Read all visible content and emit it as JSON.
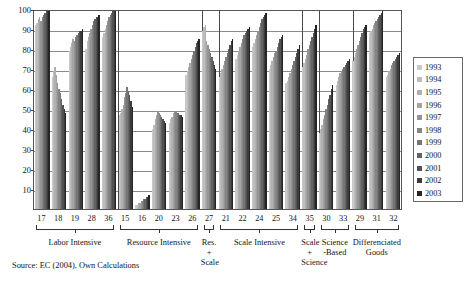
{
  "chart_data": {
    "type": "bar",
    "title": "",
    "subtitle": "",
    "xlabel": "",
    "ylabel": "",
    "ylim": [
      0,
      100
    ],
    "yticks": [
      100,
      90,
      80,
      70,
      60,
      50,
      40,
      30,
      20,
      10
    ],
    "grid": true,
    "legend_position": "right",
    "legend_entries": [
      "1993",
      "1994",
      "1995",
      "1996",
      "1997",
      "1998",
      "1999",
      "2000",
      "2001",
      "2002",
      "2003"
    ],
    "series_colors": [
      "#c9c9c9",
      "#bdbdbd",
      "#b0b0b0",
      "#a3a3a3",
      "#949494",
      "#858585",
      "#757575",
      "#636363",
      "#515151",
      "#3c3c3c",
      "#252525"
    ],
    "categories": [
      "17",
      "18",
      "19",
      "28",
      "36",
      "15",
      "16",
      "20",
      "23",
      "26",
      "27",
      "21",
      "22",
      "24",
      "25",
      "34",
      "35",
      "30",
      "33",
      "29",
      "31",
      "32"
    ],
    "groups": [
      {
        "label": "Labor Intensive",
        "categories": [
          "17",
          "18",
          "19",
          "28",
          "36"
        ]
      },
      {
        "label": "Resource Intensive",
        "categories": [
          "15",
          "16",
          "20",
          "23",
          "26"
        ]
      },
      {
        "label": "Res.\n+ Scale",
        "categories": [
          "27"
        ]
      },
      {
        "label": "Scale Intensive",
        "categories": [
          "21",
          "22",
          "24",
          "25",
          "34"
        ]
      },
      {
        "label": "Scale\n+ Science",
        "categories": [
          "35"
        ]
      },
      {
        "label": "Science\n-Based",
        "categories": [
          "30",
          "33"
        ]
      },
      {
        "label": "Differenciated\nGoods",
        "categories": [
          "29",
          "31",
          "32"
        ]
      }
    ],
    "series": [
      {
        "name": "1993",
        "values": [
          92,
          66,
          79,
          80,
          86,
          47,
          2,
          40,
          43,
          67,
          89,
          66,
          75,
          81,
          70,
          63,
          71,
          38,
          62,
          74,
          88,
          66
        ]
      },
      {
        "name": "1994",
        "values": [
          93,
          69,
          81,
          84,
          88,
          48,
          2,
          42,
          45,
          69,
          91,
          68,
          77,
          83,
          72,
          64,
          73,
          40,
          64,
          76,
          89,
          67
        ]
      },
      {
        "name": "1995",
        "values": [
          95,
          71,
          83,
          86,
          90,
          50,
          3,
          45,
          46,
          71,
          92,
          70,
          79,
          85,
          74,
          66,
          75,
          42,
          66,
          78,
          90,
          69
        ]
      },
      {
        "name": "1996",
        "values": [
          96,
          67,
          85,
          88,
          92,
          52,
          3,
          47,
          48,
          73,
          84,
          72,
          81,
          87,
          76,
          68,
          77,
          45,
          68,
          80,
          92,
          70
        ]
      },
      {
        "name": "1997",
        "values": [
          94,
          63,
          84,
          90,
          94,
          56,
          4,
          49,
          49,
          75,
          82,
          74,
          83,
          89,
          78,
          70,
          80,
          47,
          69,
          82,
          93,
          72
        ]
      },
      {
        "name": "1998",
        "values": [
          96,
          60,
          86,
          92,
          96,
          58,
          4,
          48,
          49,
          77,
          80,
          76,
          85,
          91,
          79,
          72,
          82,
          50,
          70,
          84,
          94,
          73
        ]
      },
      {
        "name": "1999",
        "values": [
          97,
          58,
          87,
          94,
          97,
          61,
          5,
          47,
          48,
          79,
          78,
          78,
          87,
          93,
          81,
          74,
          84,
          52,
          71,
          86,
          95,
          74
        ]
      },
      {
        "name": "2000",
        "values": [
          98,
          55,
          88,
          95,
          98,
          59,
          5,
          46,
          48,
          81,
          76,
          80,
          88,
          95,
          83,
          76,
          86,
          55,
          72,
          88,
          96,
          75
        ]
      },
      {
        "name": "2001",
        "values": [
          99,
          52,
          89,
          96,
          99,
          57,
          6,
          45,
          47,
          83,
          74,
          82,
          89,
          96,
          85,
          78,
          88,
          57,
          73,
          90,
          97,
          76
        ]
      },
      {
        "name": "2002",
        "values": [
          99,
          50,
          89,
          96,
          99,
          54,
          6,
          44,
          47,
          84,
          72,
          84,
          90,
          97,
          86,
          80,
          90,
          60,
          74,
          91,
          98,
          77
        ]
      },
      {
        "name": "2003",
        "values": [
          100,
          48,
          90,
          97,
          100,
          51,
          7,
          43,
          46,
          85,
          70,
          85,
          91,
          98,
          87,
          82,
          92,
          62,
          75,
          92,
          99,
          78
        ]
      }
    ]
  },
  "source": {
    "text": "Source: EC (2004), Own Calculations"
  }
}
